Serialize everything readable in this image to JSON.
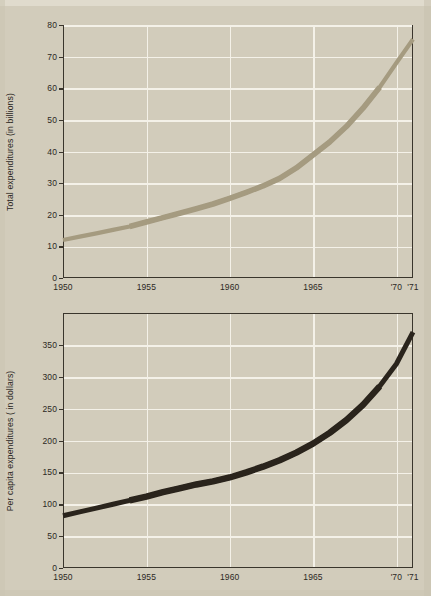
{
  "figure": {
    "background_color": "#d2ccbb",
    "axis_color": "#3a352c",
    "grid_color": "#f4f1e8"
  },
  "chart_data": [
    {
      "id": "total-expenditures",
      "type": "line",
      "title": "",
      "xlabel": "",
      "ylabel": "Total expenditures (in billions)",
      "xlim": [
        1950,
        1971
      ],
      "ylim": [
        0,
        80
      ],
      "yticks": [
        0,
        10,
        20,
        30,
        40,
        50,
        60,
        70,
        80
      ],
      "ytick_labels": [
        "0",
        "10",
        "20",
        "30",
        "40",
        "50",
        "60",
        "70",
        "80"
      ],
      "xticks": [
        1950,
        1955,
        1960,
        1965,
        1970,
        1971
      ],
      "xtick_labels": [
        "1950",
        "1955",
        "1960",
        "1965",
        "'70",
        "'71"
      ],
      "grid": true,
      "legend": "none",
      "line_color": "#a59b80",
      "x": [
        1950,
        1951,
        1952,
        1953,
        1954,
        1955,
        1956,
        1957,
        1958,
        1959,
        1960,
        1961,
        1962,
        1963,
        1964,
        1965,
        1966,
        1967,
        1968,
        1969,
        1970,
        1971
      ],
      "values": [
        12.0,
        13.1,
        14.1,
        15.2,
        16.3,
        17.7,
        19.1,
        20.5,
        21.9,
        23.4,
        25.2,
        27.1,
        29.1,
        31.5,
        34.8,
        38.9,
        43.0,
        47.9,
        53.7,
        60.3,
        68.0,
        75.5
      ],
      "series": [
        {
          "name": "Total expenditures (in billions)",
          "values": [
            12.0,
            13.1,
            14.1,
            15.2,
            16.3,
            17.7,
            19.1,
            20.5,
            21.9,
            23.4,
            25.2,
            27.1,
            29.1,
            31.5,
            34.8,
            38.9,
            43.0,
            47.9,
            53.7,
            60.3,
            68.0,
            75.5
          ]
        }
      ]
    },
    {
      "id": "per-capita-expenditures",
      "type": "line",
      "title": "",
      "xlabel": "",
      "ylabel": "Per capita expenditures ( in dollars)",
      "xlim": [
        1950,
        1971
      ],
      "ylim": [
        0,
        400
      ],
      "yticks": [
        0,
        50,
        100,
        150,
        200,
        250,
        300,
        350
      ],
      "ytick_labels": [
        "0",
        "50",
        "100",
        "150",
        "200",
        "250",
        "300",
        "350"
      ],
      "xticks": [
        1950,
        1955,
        1960,
        1965,
        1970,
        1971
      ],
      "xtick_labels": [
        "1950",
        "1955",
        "1960",
        "1965",
        "'70",
        "'71"
      ],
      "grid": true,
      "legend": "none",
      "line_color": "#2a241c",
      "x": [
        1950,
        1951,
        1952,
        1953,
        1954,
        1955,
        1956,
        1957,
        1958,
        1959,
        1960,
        1961,
        1962,
        1963,
        1964,
        1965,
        1966,
        1967,
        1968,
        1969,
        1970,
        1971
      ],
      "values": [
        82,
        88,
        94,
        100,
        106,
        112,
        119,
        125,
        131,
        136,
        142,
        150,
        159,
        169,
        181,
        195,
        212,
        232,
        256,
        285,
        320,
        370
      ],
      "series": [
        {
          "name": "Per capita expenditures ( in dollars)",
          "values": [
            82,
            88,
            94,
            100,
            106,
            112,
            119,
            125,
            131,
            136,
            142,
            150,
            159,
            169,
            181,
            195,
            212,
            232,
            256,
            285,
            320,
            370
          ]
        }
      ]
    }
  ]
}
